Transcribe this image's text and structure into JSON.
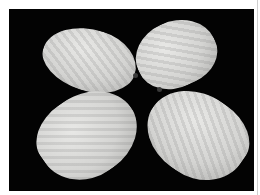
{
  "image": {
    "subject": "four mangoes on black background",
    "background_color": "#030303",
    "border_color": "#ffffff",
    "fruit_color": "#d4d4d2"
  }
}
